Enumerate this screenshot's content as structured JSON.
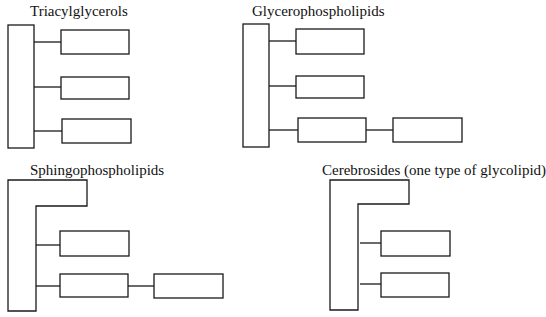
{
  "diagrams": [
    {
      "title": "Triacylglycerols",
      "backbone": "rectangle",
      "slots": [
        {
          "boxes": 1
        },
        {
          "boxes": 1
        },
        {
          "boxes": 1
        }
      ]
    },
    {
      "title": "Glycerophospholipids",
      "backbone": "rectangle",
      "slots": [
        {
          "boxes": 1
        },
        {
          "boxes": 1
        },
        {
          "boxes": 2
        }
      ]
    },
    {
      "title": "Sphingophospholipids",
      "backbone": "L-shape",
      "slots": [
        {
          "boxes": 1
        },
        {
          "boxes": 2
        }
      ]
    },
    {
      "title": "Cerebrosides (one type of glycolipid)",
      "backbone": "L-shape",
      "slots": [
        {
          "boxes": 1
        },
        {
          "boxes": 1
        }
      ]
    }
  ],
  "colors": {
    "stroke": "#1a1a1a",
    "background": "#ffffff"
  }
}
